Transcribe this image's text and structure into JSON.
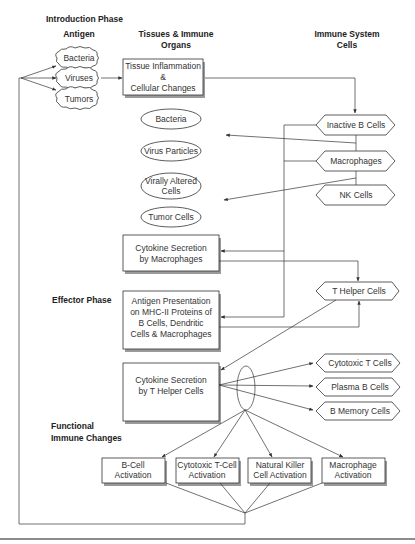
{
  "headers": {
    "introduction_phase": "Introduction Phase",
    "antigen": "Antigen",
    "tissues_line1": "Tissues & Immune",
    "tissues_line2": "Organs",
    "immune_line1": "Immune System",
    "immune_line2": "Cells",
    "effector_phase": "Effector Phase",
    "functional_line1": "Functional",
    "functional_line2": "Immune Changes"
  },
  "antigens": [
    "Bacteria",
    "Viruses",
    "Tumors"
  ],
  "tissue_inflammation": [
    "Tissue Inflammation",
    "&",
    "Cellular Changes"
  ],
  "targets": {
    "bacteria": "Bacteria",
    "virus_particles": "Virus Particles",
    "virally_altered": [
      "Virally Altered",
      "Cells"
    ],
    "tumor_cells": "Tumor Cells"
  },
  "immune_cells": {
    "inactive_b": "Inactive B Cells",
    "macrophages": "Macrophages",
    "nk": "NK Cells",
    "t_helper": "T Helper Cells",
    "cytotoxic_t": "Cytotoxic T Cells",
    "plasma_b": "Plasma B Cells",
    "b_memory": "B Memory Cells"
  },
  "cytokine_macrophages": [
    "Cytokine Secretion",
    "by Macrophages"
  ],
  "antigen_presentation": [
    "Antigen Presentation",
    "on MHC-II Proteins of",
    "B Cells, Dendritic",
    "Cells & Macrophages"
  ],
  "cytokine_t_helper": [
    "Cytokine Secretion",
    "by T Helper Cells"
  ],
  "activations": [
    [
      "B-Cell",
      "Activation"
    ],
    [
      "Cytotoxic T-Cell",
      "Activation"
    ],
    [
      "Natural Killer",
      "Cell Activation"
    ],
    [
      "Macrophage",
      "Activation"
    ]
  ],
  "colors": {
    "line": "#333333",
    "shadow": "#9a9a9a",
    "background": "#ffffff"
  }
}
